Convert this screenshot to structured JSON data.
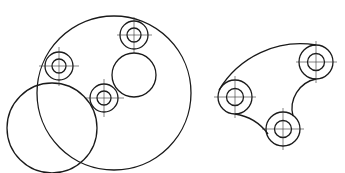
{
  "figure": {
    "left_drawing": {
      "description": "Large circle with three bolt-hole rings, one inner circle and an overlapping circle",
      "hole_rings": [
        "top",
        "left",
        "middle"
      ],
      "extra_circles": [
        "inner-circle",
        "overlap-circle",
        "outer-circle"
      ]
    },
    "right_drawing": {
      "description": "Plate outline with three bolt-hole rings connected by arcs",
      "hole_rings": [
        "left",
        "right",
        "bottom"
      ],
      "outline_arcs": [
        "top-convex-arc",
        "right-concave-arc",
        "bottom-concave-arc"
      ]
    },
    "line_color": "#1a1a1a",
    "background_color": "#ffffff"
  }
}
